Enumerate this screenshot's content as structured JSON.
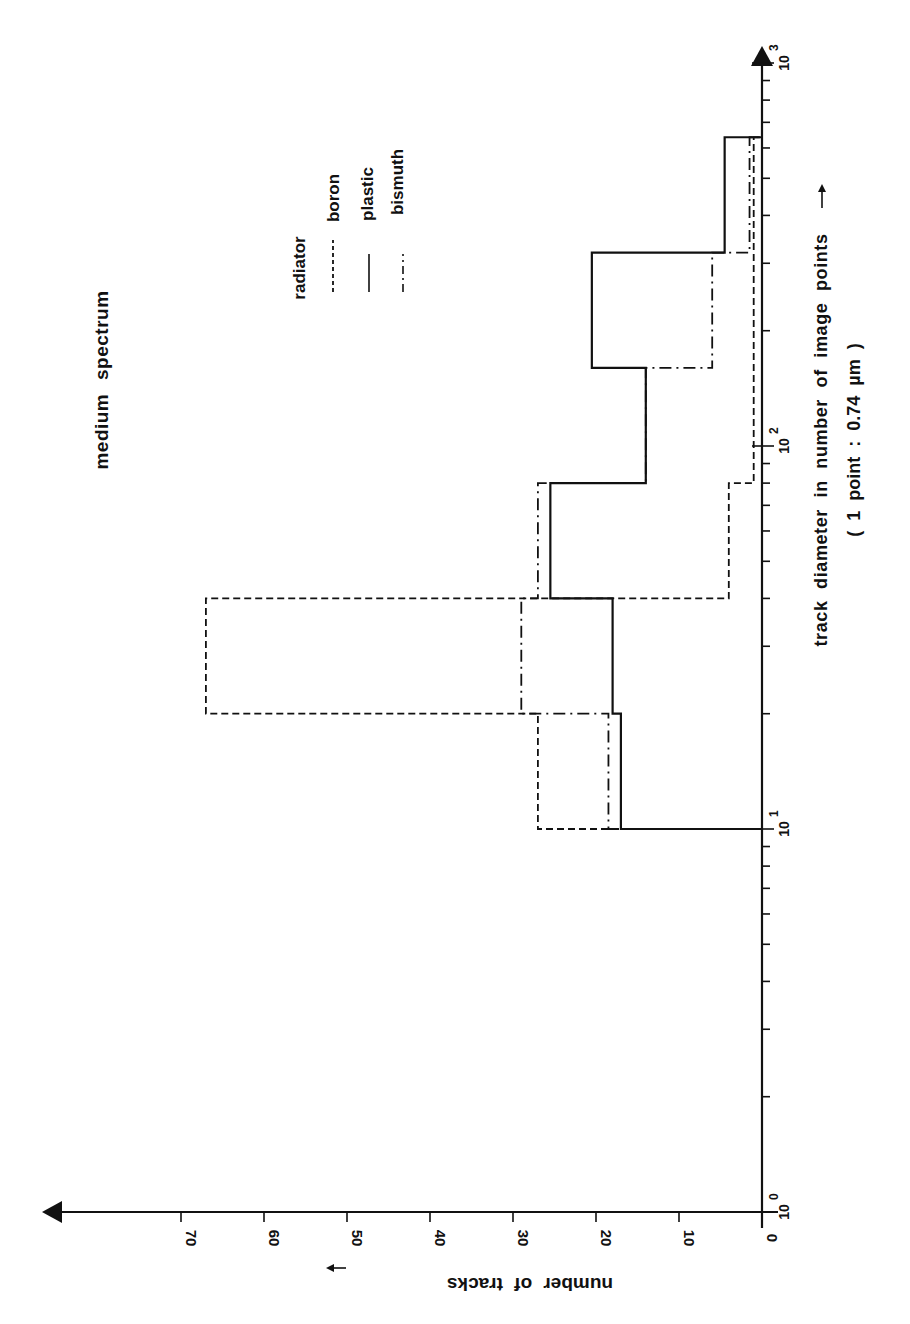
{
  "chart_data": {
    "type": "bar",
    "subtype": "step-histogram",
    "orientation_note": "figure printed rotated 90 degrees counterclockwise",
    "title": "medium spectrum",
    "xlabel": "track diameter in number of image points",
    "xlabel_sub": "( 1 point : 0.74 µm )",
    "ylabel": "number of tracks",
    "xscale": "log",
    "xlim": [
      1,
      1000
    ],
    "ylim": [
      0,
      75
    ],
    "x_tick_labels": [
      "10^0",
      "10^1",
      "10^2",
      "10^3"
    ],
    "y_ticks": [
      0,
      10,
      20,
      30,
      40,
      50,
      60,
      70
    ],
    "bin_edges": [
      10,
      20,
      40,
      80,
      160,
      320,
      640
    ],
    "legend": {
      "title": "radiator",
      "entries": [
        {
          "name": "boron",
          "style": "dashed"
        },
        {
          "name": "plastic",
          "style": "solid"
        },
        {
          "name": "bismuth",
          "style": "dash-dot"
        }
      ]
    },
    "series": [
      {
        "name": "boron",
        "style": "dashed",
        "values": [
          27,
          67,
          4,
          1,
          1,
          1
        ]
      },
      {
        "name": "plastic",
        "style": "solid",
        "values": [
          17,
          18,
          25.5,
          14,
          20.5,
          4.5
        ]
      },
      {
        "name": "bismuth",
        "style": "dash-dot",
        "values": [
          18.5,
          29,
          27,
          14,
          6,
          1.5
        ]
      }
    ],
    "grid": false,
    "legend_position": "upper-right (rotated frame)"
  },
  "labels": {
    "title": "medium spectrum",
    "legend_title": "radiator",
    "legend_boron": "boron",
    "legend_plastic": "plastic",
    "legend_bismuth": "bismuth",
    "xlabel": "track diameter in number of image points",
    "xlabel_sub": "( 1 point : 0.74 µm )",
    "xlabel_arrow": "→",
    "ylabel": "number of tracks",
    "ylabel_arrow": "→"
  }
}
